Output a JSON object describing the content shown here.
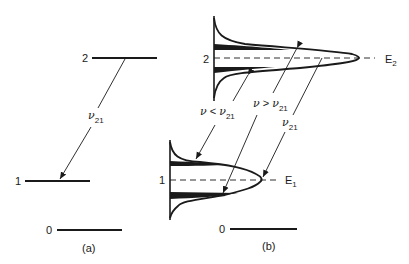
{
  "panels": {
    "a": {
      "caption": "(a)",
      "levels": [
        {
          "label": "2"
        },
        {
          "label": "1"
        },
        {
          "label": "0"
        }
      ],
      "transition": {
        "symbol": "ν",
        "subscript": "21"
      }
    },
    "b": {
      "caption": "(b)",
      "levels": [
        {
          "label": "2",
          "energy_symbol": "E",
          "energy_subscript": "2"
        },
        {
          "label": "1",
          "energy_symbol": "E",
          "energy_subscript": "1"
        },
        {
          "label": "0"
        }
      ],
      "transitions": [
        {
          "symbol": "ν",
          "relation": " < ",
          "ref": "ν",
          "subscript": "21"
        },
        {
          "symbol": "ν",
          "relation": " > ",
          "ref": "ν",
          "subscript": "21"
        },
        {
          "symbol": "ν",
          "relation": "",
          "ref": "",
          "subscript": "21"
        }
      ]
    }
  },
  "colors": {
    "ink": "#1a1a1a",
    "background": "#ffffff"
  }
}
